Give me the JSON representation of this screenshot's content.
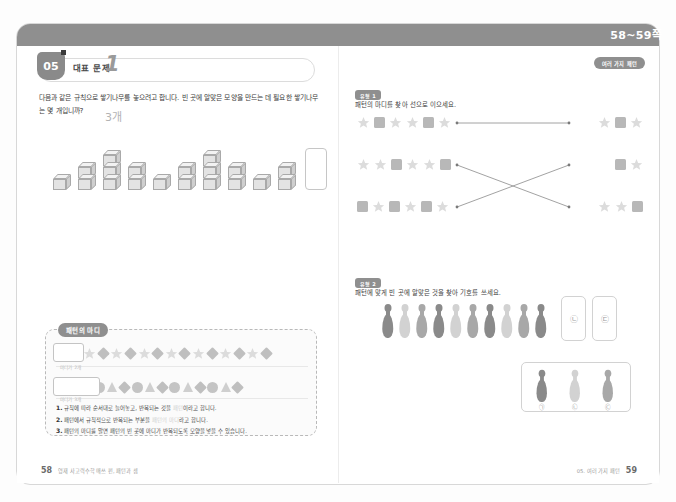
{
  "header": {
    "page_range": "58~59쪽",
    "right_badge": "여러 가지 패턴"
  },
  "left_page": {
    "problem": {
      "badge_number": "05",
      "label": "대표 문제",
      "number": "1",
      "question": "다음과 같은 규칙으로 쌓기나무를 놓으려고 합니다. 빈 곳에 알맞은 모양을 만드는 데 필요한 쌓기나무는 몇 개입니까?",
      "answer": "3개"
    },
    "cube_pattern": {
      "heights": [
        1,
        2,
        3,
        2,
        1,
        2,
        3,
        2,
        1,
        2
      ],
      "blank_index": 10,
      "blank_answer": 3
    },
    "madi_box": {
      "title": "패턴의 마디",
      "row1": {
        "shapes": [
          "star",
          "diamond",
          "star",
          "diamond",
          "star",
          "diamond",
          "star",
          "diamond",
          "star",
          "diamond",
          "star",
          "diamond",
          "star",
          "diamond",
          "star",
          "diamond"
        ],
        "unit_length": 2,
        "caption": "마디가 2개"
      },
      "row2": {
        "shapes": [
          "circle",
          "triangle",
          "diamond",
          "circle",
          "triangle",
          "diamond",
          "circle",
          "triangle",
          "diamond",
          "circle",
          "triangle",
          "diamond",
          "circle",
          "triangle",
          "diamond"
        ],
        "unit_length": 3,
        "caption": "마디가 3개"
      },
      "items": [
        {
          "num": "1.",
          "text_before": "규칙에 따라 순서대로 늘어놓고, 반복되는 것을 ",
          "blank": "패턴",
          "text_after": "이라고 합니다."
        },
        {
          "num": "2.",
          "text_before": "패턴에서 규칙적으로 반복되는 부분을 ",
          "blank": "패턴의 마디",
          "text_after": "라고 합니다."
        },
        {
          "num": "3.",
          "text_before": "패턴의 마디를 알면 패턴의 빈 곳에 마디가 반복되도록 모양을 넣을 수 있습니다.",
          "blank": "",
          "text_after": ""
        }
      ]
    },
    "footer": {
      "page": "58",
      "text": "영재 사고력수학 매쓰 펀, 패턴과 셈"
    }
  },
  "right_page": {
    "section1": {
      "badge": "유형 1",
      "instruction": "패턴의 마디를 찾아 선으로 이으세요.",
      "left_patterns": [
        {
          "shapes": [
            "star",
            "square",
            "star",
            "star",
            "square",
            "star"
          ]
        },
        {
          "shapes": [
            "star",
            "star",
            "square",
            "star",
            "star",
            "square"
          ]
        },
        {
          "shapes": [
            "square",
            "star",
            "square",
            "star",
            "square",
            "star"
          ]
        }
      ],
      "right_answers": [
        {
          "shapes": [
            "star",
            "square",
            "star"
          ]
        },
        {
          "shapes": [
            "square",
            "star"
          ]
        },
        {
          "shapes": [
            "star",
            "star",
            "square"
          ]
        }
      ],
      "connections": [
        {
          "from": 0,
          "to": 0
        },
        {
          "from": 1,
          "to": 2
        },
        {
          "from": 2,
          "to": 1
        }
      ]
    },
    "section2": {
      "badge": "유형 2",
      "instruction": "패턴에 맞게 빈 곳에 알맞은 것을 찾아 기호를 쓰세요.",
      "pin_sequence": [
        "dark",
        "light",
        "medium",
        "dark",
        "light",
        "medium",
        "dark",
        "light",
        "medium",
        "dark"
      ],
      "blank_cards": [
        "㉡",
        "㉢"
      ],
      "choices": [
        {
          "label": "㉠",
          "tone": "dark"
        },
        {
          "label": "㉡",
          "tone": "light"
        },
        {
          "label": "㉢",
          "tone": "medium"
        }
      ]
    },
    "footer": {
      "page": "59",
      "text": "05. 여러 가지 패턴"
    }
  },
  "colors": {
    "star": "#dcdcdc",
    "square": "#b8b8b8",
    "circle": "#c4c4c4",
    "triangle": "#cfcfcf",
    "diamond": "#bfbfbf",
    "pin_dark": "#8a8a8a",
    "pin_light": "#d2d2d2",
    "pin_medium": "#a8a8a8",
    "header_grey": "#8f8f8f"
  }
}
